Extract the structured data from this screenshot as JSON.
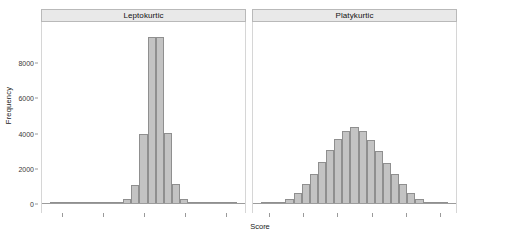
{
  "chart_data": {
    "type": "bar",
    "title": "",
    "xlabel": "Score",
    "ylabel": "Frequency",
    "ylim": [
      0,
      10000
    ],
    "yticks": [
      0,
      2000,
      4000,
      6000,
      8000
    ],
    "ytick_labels": [
      "0",
      "2000",
      "4000",
      "6000",
      "8000"
    ],
    "grid": false,
    "legend": "none",
    "panel_layout": "1 row x 2 columns",
    "panels": [
      {
        "label": "Leptokurtic",
        "type": "histogram",
        "n_xticks": 5,
        "xtick_labels": [
          "",
          "",
          "",
          "",
          ""
        ],
        "bin_centers": [
          1,
          2,
          3,
          4,
          5,
          6,
          7,
          8,
          9,
          10,
          11,
          12,
          13,
          14,
          15,
          16,
          17,
          18,
          19,
          20,
          21,
          22,
          23
        ],
        "values": [
          10,
          15,
          20,
          25,
          30,
          40,
          55,
          70,
          90,
          280,
          1100,
          4000,
          9500,
          9500,
          4050,
          1120,
          290,
          95,
          70,
          50,
          35,
          22,
          12
        ]
      },
      {
        "label": "Platykurtic",
        "type": "histogram",
        "n_xticks": 6,
        "xtick_labels": [
          "",
          "",
          "",
          "",
          "",
          ""
        ],
        "bin_centers": [
          1,
          2,
          3,
          4,
          5,
          6,
          7,
          8,
          9,
          10,
          11,
          12,
          13,
          14,
          15,
          16,
          17,
          18,
          19,
          20,
          21,
          22,
          23
        ],
        "values": [
          30,
          60,
          120,
          300,
          620,
          1150,
          1700,
          2400,
          3050,
          3700,
          4150,
          4400,
          4150,
          3650,
          3000,
          2350,
          1700,
          1150,
          620,
          300,
          130,
          60,
          25
        ]
      }
    ],
    "colors": {
      "bar_fill": "#c3c3c3",
      "bar_border": "#8f8f8f",
      "strip_fill": "#e9e9e9",
      "strip_border": "#b9b9b9",
      "axis": "#9a9a9a",
      "text": "#1a1a1a",
      "background": "#ffffff"
    }
  }
}
